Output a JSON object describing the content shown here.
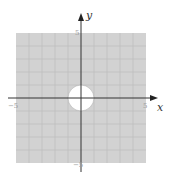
{
  "figure": {
    "x_axis_label": "x",
    "y_axis_label": "y",
    "x_min_label": "−5",
    "x_max_label": "5",
    "y_min_label": "−5",
    "y_max_label": "5",
    "grid_range": [
      -5,
      5
    ],
    "grid_step": 1,
    "hole": {
      "center": [
        0,
        0
      ],
      "radius": 1
    },
    "colors": {
      "shade": "#d2d2d2",
      "grid": "#bdbdbd",
      "axis": "#333333",
      "hole": "#ffffff"
    }
  }
}
